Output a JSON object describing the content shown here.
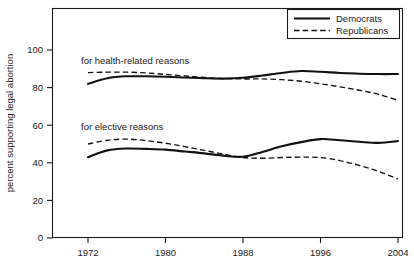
{
  "chart_data": {
    "type": "line",
    "title": "",
    "subtitle": "",
    "xlabel": "",
    "ylabel": "percent supporting legal abortion",
    "xlim": [
      1970,
      2006
    ],
    "ylim": [
      0,
      110
    ],
    "y_axis_display_max": 100,
    "grid": false,
    "legend_position": "top-right",
    "x_ticks": [
      1972,
      1980,
      1988,
      1996,
      2004
    ],
    "x_tick_labels": [
      "1972",
      "1980",
      "1988",
      "1996",
      "2004"
    ],
    "y_ticks": [
      0,
      20,
      40,
      60,
      80,
      100
    ],
    "y_tick_labels": [
      "0",
      "20",
      "40",
      "60",
      "80",
      "100"
    ],
    "legend": [
      {
        "name": "Democrats",
        "style": "solid"
      },
      {
        "name": "Republicans",
        "style": "dashed"
      }
    ],
    "annotations": [
      {
        "text": "for health-related reasons",
        "x": 1974.0,
        "y": 93.5
      },
      {
        "text": "for elective reasons",
        "x": 1974.0,
        "y": 59.0
      }
    ],
    "x": [
      1972,
      1974,
      1976,
      1978,
      1980,
      1982,
      1984,
      1986,
      1988,
      1990,
      1992,
      1994,
      1996,
      1998,
      2000,
      2002,
      2004
    ],
    "series": [
      {
        "name": "Democrats",
        "group": "for health-related reasons",
        "style": "solid",
        "values": [
          82.0,
          85.0,
          86.0,
          86.0,
          85.8,
          85.4,
          85.0,
          84.8,
          85.2,
          86.4,
          87.8,
          88.8,
          88.4,
          87.8,
          87.4,
          87.2,
          87.2
        ]
      },
      {
        "name": "Republicans",
        "group": "for health-related reasons",
        "style": "dashed",
        "values": [
          88.0,
          88.2,
          88.2,
          87.8,
          87.0,
          86.2,
          85.4,
          84.8,
          84.6,
          84.6,
          84.2,
          83.4,
          82.0,
          80.4,
          78.6,
          76.4,
          73.2
        ]
      },
      {
        "name": "Democrats",
        "group": "for elective reasons",
        "style": "solid",
        "values": [
          43.0,
          46.6,
          47.6,
          47.4,
          47.0,
          46.0,
          45.0,
          43.8,
          43.2,
          45.8,
          48.8,
          51.0,
          52.6,
          52.0,
          51.2,
          50.6,
          51.6
        ]
      },
      {
        "name": "Republicans",
        "group": "for elective reasons",
        "style": "dashed",
        "values": [
          50.0,
          52.0,
          52.6,
          51.8,
          50.4,
          48.6,
          46.6,
          44.6,
          42.8,
          42.4,
          42.8,
          43.0,
          42.8,
          41.2,
          38.6,
          35.4,
          31.4
        ]
      }
    ],
    "series_endpoints": {
      "democrats_health_2004": 87.2,
      "republicans_health_2004": 73.2,
      "democrats_elective_2004": 53.8,
      "republicans_elective_2004": 31.4
    }
  }
}
